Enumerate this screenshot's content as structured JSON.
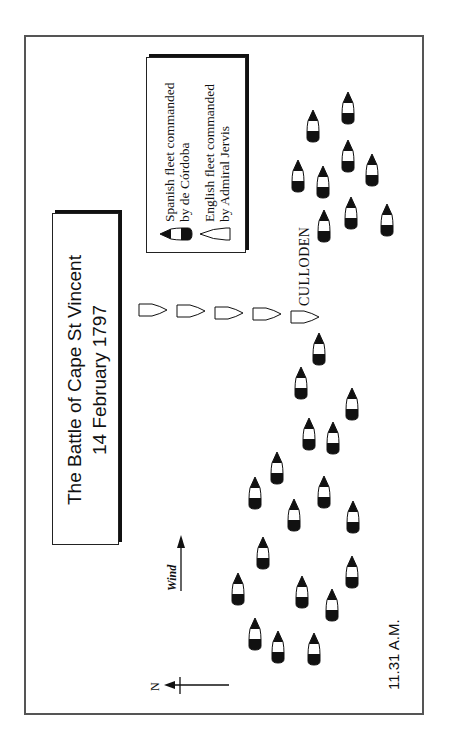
{
  "title": {
    "line1": "The Battle of Cape St Vincent",
    "line2": "14 February 1797"
  },
  "legend": {
    "spanish_line1": "Spanish fleet commanded",
    "spanish_line2": "by de Córdoba",
    "spanish_icon": "spanish-ship-icon",
    "english_line1": "English fleet commanded",
    "english_line2": "by Admiral Jervis",
    "english_icon": "english-ship-icon"
  },
  "labels": {
    "culloden": "CULLODEN",
    "wind": "Wind",
    "north": "N",
    "time": "11.31 A.M."
  },
  "colors": {
    "ink": "#111111",
    "frame": "#555555",
    "background": "#ffffff"
  },
  "fleets": {
    "spanish_ships": [
      [
        348,
        92
      ],
      [
        313,
        110
      ],
      [
        348,
        140
      ],
      [
        372,
        154
      ],
      [
        298,
        160
      ],
      [
        323,
        166
      ],
      [
        351,
        197
      ],
      [
        387,
        204
      ],
      [
        324,
        210
      ],
      [
        319,
        333
      ],
      [
        301,
        367
      ],
      [
        352,
        388
      ],
      [
        309,
        418
      ],
      [
        333,
        422
      ],
      [
        277,
        452
      ],
      [
        255,
        477
      ],
      [
        324,
        476
      ],
      [
        294,
        499
      ],
      [
        353,
        501
      ],
      [
        263,
        537
      ],
      [
        352,
        556
      ],
      [
        238,
        573
      ],
      [
        302,
        576
      ],
      [
        332,
        589
      ],
      [
        255,
        618
      ],
      [
        278,
        631
      ],
      [
        314,
        633
      ]
    ],
    "english_ships": [
      [
        138,
        303
      ],
      [
        176,
        304
      ],
      [
        214,
        306
      ],
      [
        252,
        307
      ],
      [
        290,
        310
      ]
    ]
  }
}
